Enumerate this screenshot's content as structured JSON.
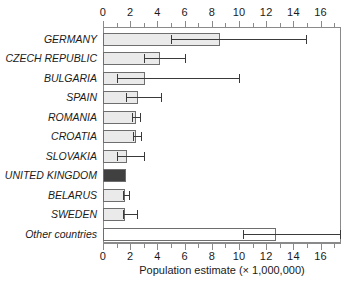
{
  "chart_data": {
    "type": "bar",
    "orientation": "horizontal",
    "title": "",
    "xlabel": "Population estimate (× 1,000,000)",
    "ylabel": "",
    "xlim": [
      0,
      17.5
    ],
    "xticks_major": [
      0,
      2,
      4,
      6,
      8,
      10,
      12,
      14,
      16
    ],
    "xtick_labels": [
      "0",
      "2",
      "4",
      "6",
      "8",
      "10",
      "12",
      "14",
      "16"
    ],
    "xtick_minor_step": 1,
    "grid": false,
    "legend": "none",
    "axis_top": true,
    "axis_bottom": true,
    "categories": [
      "GERMANY",
      "CZECH REPUBLIC",
      "BULGARIA",
      "SPAIN",
      "ROMANIA",
      "CROATIA",
      "SLOVAKIA",
      "UNITED KINGDOM",
      "BELARUS",
      "SWEDEN",
      "Other countries"
    ],
    "values": [
      8.6,
      4.2,
      3.1,
      2.6,
      2.4,
      2.45,
      1.8,
      1.7,
      1.6,
      1.6,
      12.7
    ],
    "error_low": [
      5.0,
      3.0,
      1.0,
      1.7,
      2.15,
      2.2,
      1.0,
      null,
      1.5,
      1.5,
      10.3
    ],
    "error_high": [
      14.9,
      6.0,
      10.0,
      4.3,
      2.75,
      2.8,
      3.0,
      null,
      1.9,
      2.5,
      17.4
    ],
    "bar_fills": [
      "#eaeaea",
      "#eaeaea",
      "#eaeaea",
      "#eaeaea",
      "#eaeaea",
      "#eaeaea",
      "#eaeaea",
      "#404040",
      "#eaeaea",
      "#eaeaea",
      "#ffffff"
    ],
    "highlight_category": "UNITED KINGDOM",
    "colors": {
      "bar_fill_light": "#eaeaea",
      "bar_fill_highlight": "#404040",
      "bar_fill_other": "#ffffff",
      "bar_border": "#6e6e6e",
      "axis": "#8a8a8a",
      "error_bar": "#3a3a3a",
      "text": "#1a1a1a"
    }
  }
}
